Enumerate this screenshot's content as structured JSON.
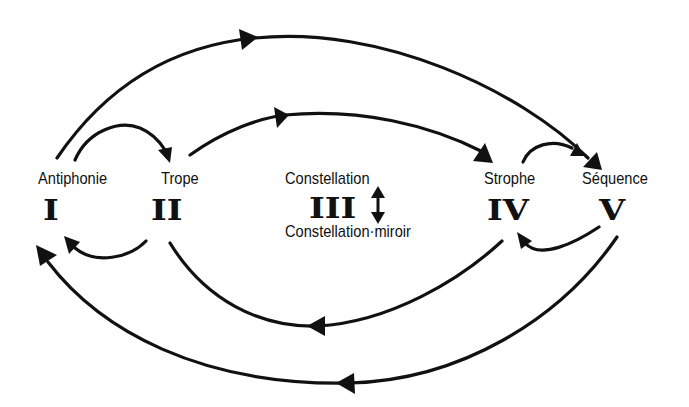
{
  "diagram": {
    "type": "cycle-flow",
    "nodes": [
      {
        "id": "I",
        "numeral": "I",
        "label": "Antiphonie"
      },
      {
        "id": "II",
        "numeral": "II",
        "label": "Trope"
      },
      {
        "id": "III",
        "numeral": "III",
        "label": "Constellation",
        "label_below": "Constellation·miroir",
        "marker": "bidirectional-arrow"
      },
      {
        "id": "IV",
        "numeral": "IV",
        "label": "Strophe"
      },
      {
        "id": "V",
        "numeral": "V",
        "label": "Séquence"
      }
    ],
    "edges": [
      {
        "from": "I",
        "to": "V",
        "route": "outer-top"
      },
      {
        "from": "I",
        "to": "II",
        "route": "short-top"
      },
      {
        "from": "II",
        "to": "IV",
        "route": "inner-top"
      },
      {
        "from": "IV",
        "to": "V",
        "route": "short-top"
      },
      {
        "from": "II",
        "to": "I",
        "route": "short-bottom"
      },
      {
        "from": "V",
        "to": "IV",
        "route": "short-bottom"
      },
      {
        "from": "IV",
        "to": "II",
        "route": "inner-bottom"
      },
      {
        "from": "V",
        "to": "I",
        "route": "outer-bottom"
      }
    ],
    "color": "#111111"
  }
}
